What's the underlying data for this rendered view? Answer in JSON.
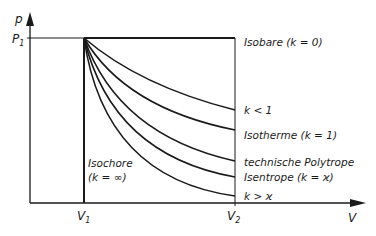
{
  "axes": {
    "y_label": "p",
    "x_label": "V",
    "p1_label": "P",
    "p1_sub": "1",
    "v1_label": "V",
    "v1_sub": "1",
    "v2_label": "V",
    "v2_sub": "2"
  },
  "curves": [
    {
      "id": "isobare",
      "label": "Isobare (k = 0)"
    },
    {
      "id": "k_lt_1",
      "label": "k < 1"
    },
    {
      "id": "isotherme",
      "label": "Isotherme (k = 1)"
    },
    {
      "id": "polytrope",
      "label": "technische Polytrope"
    },
    {
      "id": "isentrope",
      "label": "Isentrope (k = ϰ)"
    },
    {
      "id": "k_gt_kappa",
      "label": "k > ϰ"
    }
  ],
  "isochore": {
    "line1": "Isochore",
    "line2": "(k = ∞)"
  },
  "colors": {
    "line": "#1a1a1a",
    "background": "#ffffff"
  }
}
